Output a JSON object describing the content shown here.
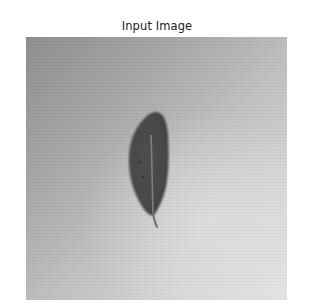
{
  "figure": {
    "title": "Input Image",
    "image": {
      "subject": "single leaf",
      "mode": "grayscale",
      "icon": "leaf-icon"
    }
  },
  "colors": {
    "background": "#ffffff",
    "title_text": "#222222",
    "image_bg_dark": "#8e8e8e",
    "image_bg_light": "#e6e6e6",
    "leaf_fill": "#4a4a4a",
    "leaf_midrib": "#8a8a8a"
  }
}
